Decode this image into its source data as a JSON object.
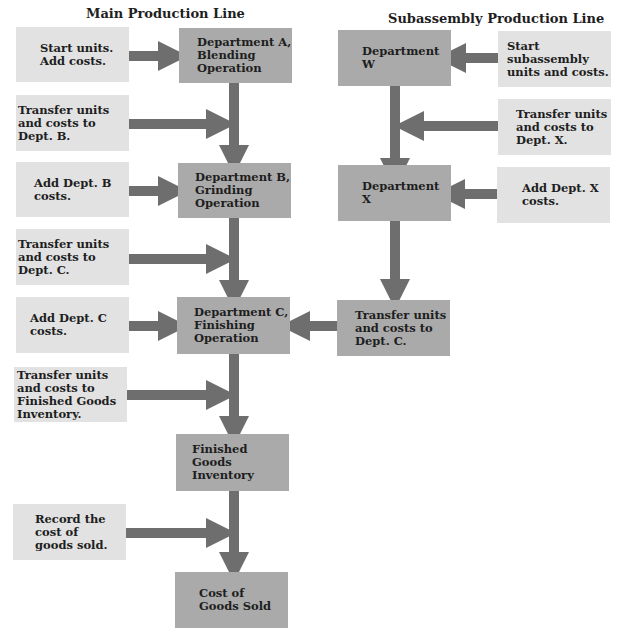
{
  "headings": {
    "main": "Main Production Line",
    "sub": "Subassembly Production Line"
  },
  "main_line": {
    "departments": [
      {
        "id": "dept-a",
        "label": "Department A,\nBlending\nOperation"
      },
      {
        "id": "dept-b",
        "label": "Department B,\nGrinding\nOperation"
      },
      {
        "id": "dept-c",
        "label": "Department C,\nFinishing\nOperation"
      },
      {
        "id": "finished-goods",
        "label": "Finished Goods\nInventory"
      },
      {
        "id": "cogs",
        "label": "Cost of\nGoods Sold"
      }
    ],
    "steps": [
      {
        "label": "Start units.\nAdd costs."
      },
      {
        "label": "Transfer units\nand costs to\nDept. B."
      },
      {
        "label": "Add Dept. B\ncosts."
      },
      {
        "label": "Transfer units\nand costs to\nDept. C."
      },
      {
        "label": "Add Dept. C\ncosts."
      },
      {
        "label": "Transfer units\nand costs to\nFinished Goods\nInventory."
      },
      {
        "label": "Record the\ncost of\ngoods sold."
      }
    ]
  },
  "sub_line": {
    "departments": [
      {
        "id": "dept-w",
        "label": "Department\nW"
      },
      {
        "id": "dept-x",
        "label": "Department\nX"
      },
      {
        "id": "transfer-c",
        "label": "Transfer units\nand costs to\nDept. C."
      }
    ],
    "steps": [
      {
        "label": "Start subassembly\nunits and costs."
      },
      {
        "label": "Transfer units\nand costs to\nDept. X."
      },
      {
        "label": "Add Dept. X\ncosts."
      }
    ]
  },
  "colors": {
    "department_box": "#aaaaaa",
    "step_box": "#e2e2e2",
    "arrow": "#6e6e6e"
  }
}
